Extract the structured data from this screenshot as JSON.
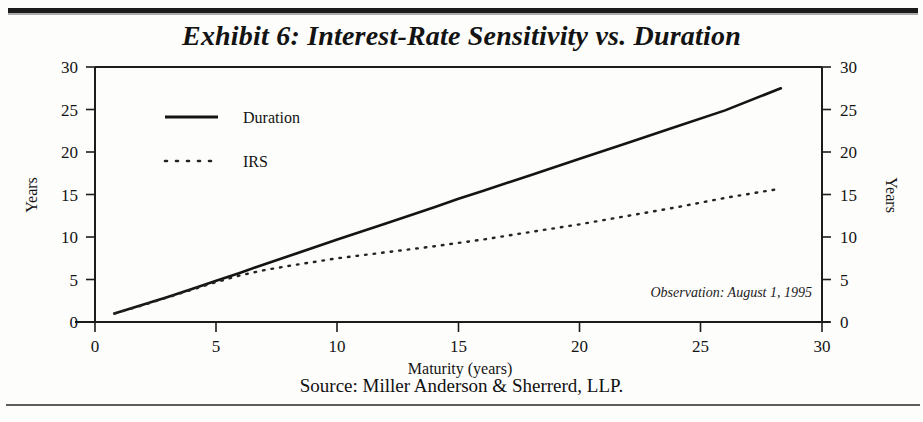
{
  "title": "Exhibit 6: Interest-Rate Sensitivity vs. Duration",
  "source": "Source: Miller Anderson & Sherrerd, LLP.",
  "annotation": "Observation: August 1, 1995",
  "legend": {
    "duration_label": "Duration",
    "irs_label": "IRS"
  },
  "axes": {
    "x_label": "Maturity (years)",
    "y_label_left": "Years",
    "y_label_right": "Years",
    "x_ticks": [
      "0",
      "5",
      "10",
      "15",
      "20",
      "25",
      "30"
    ],
    "y_ticks_left": [
      "0",
      "5",
      "10",
      "15",
      "20",
      "25",
      "30"
    ],
    "y_ticks_right": [
      "0",
      "5",
      "10",
      "15",
      "20",
      "25",
      "30"
    ]
  },
  "colors": {
    "ink": "#141414",
    "rule": "#1b1b1b",
    "paper": "#fdfdfb"
  },
  "chart_data": {
    "type": "line",
    "title": "Exhibit 6: Interest-Rate Sensitivity vs. Duration",
    "xlabel": "Maturity (years)",
    "ylabel": "Years",
    "xlim": [
      0,
      30
    ],
    "ylim": [
      0,
      30
    ],
    "xticks": [
      0,
      5,
      10,
      15,
      20,
      25,
      30
    ],
    "yticks": [
      0,
      5,
      10,
      15,
      20,
      25,
      30
    ],
    "grid": false,
    "legend_position": "upper-left-inside",
    "annotations": [
      "Observation: August 1, 1995"
    ],
    "series": [
      {
        "name": "Duration",
        "style": "solid",
        "x": [
          0.8,
          2,
          3,
          4,
          5,
          6,
          7,
          8,
          10,
          12,
          14,
          15,
          16,
          18,
          20,
          22,
          24,
          26,
          28.3
        ],
        "y": [
          1.0,
          2.05,
          2.95,
          3.9,
          4.85,
          5.8,
          6.8,
          7.75,
          9.7,
          11.6,
          13.5,
          14.5,
          15.4,
          17.3,
          19.2,
          21.1,
          23.0,
          24.9,
          27.5
        ]
      },
      {
        "name": "IRS",
        "style": "dotted",
        "x": [
          0.8,
          2,
          3,
          4,
          5,
          6,
          7,
          8,
          10,
          12,
          14,
          15,
          16,
          18,
          20,
          22,
          24,
          26,
          28.3
        ],
        "y": [
          1.0,
          2.0,
          2.9,
          3.8,
          4.7,
          5.5,
          6.1,
          6.6,
          7.5,
          8.2,
          8.9,
          9.3,
          9.7,
          10.6,
          11.5,
          12.5,
          13.5,
          14.6,
          15.7
        ]
      }
    ]
  }
}
